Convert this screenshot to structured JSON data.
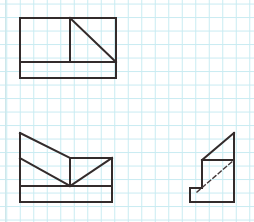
{
  "canvas": {
    "width": 254,
    "height": 222,
    "background_color": "#ffffff"
  },
  "grid": {
    "type": "graph-paper",
    "minor_spacing_px": 13.5,
    "minor_color": "#c9ecf2",
    "minor_width_px": 1,
    "margin_rule_x": 5,
    "margin_rule_color": "#cfe7ea",
    "description": "light cyan square grid graph paper"
  },
  "ink": {
    "stroke_color": "#332b2b",
    "stroke_width_px": 2,
    "dashed_stroke_color": "#45393a",
    "dashed_stroke_width_px": 1.4,
    "dash_pattern": "4 3"
  },
  "figures": [
    {
      "id": "figure-top-left",
      "name": "rectangle-with-divider-and-diagonal",
      "label": "",
      "bounds": {
        "x": 20,
        "y": 18,
        "width": 96,
        "height": 60
      },
      "paths": [
        {
          "name": "outer-rectangle",
          "style": "solid",
          "points": [
            [
              20,
              18
            ],
            [
              116,
              18
            ],
            [
              116,
              78
            ],
            [
              20,
              78
            ],
            [
              20,
              18
            ]
          ]
        },
        {
          "name": "horizontal-divider",
          "style": "solid",
          "points": [
            [
              20,
              62
            ],
            [
              116,
              62
            ]
          ]
        },
        {
          "name": "vertical-divider",
          "style": "solid",
          "points": [
            [
              70,
              18
            ],
            [
              70,
              62
            ]
          ]
        },
        {
          "name": "diagonal-hypotenuse",
          "style": "solid",
          "points": [
            [
              70,
              18
            ],
            [
              116,
              62
            ]
          ]
        }
      ]
    },
    {
      "id": "figure-bottom-left",
      "name": "chevron-v-shape-on-base",
      "label": "",
      "bounds": {
        "x": 20,
        "y": 133,
        "width": 92,
        "height": 69
      },
      "paths": [
        {
          "name": "left-vertical-edge",
          "style": "solid",
          "points": [
            [
              20,
              133
            ],
            [
              20,
              202
            ]
          ]
        },
        {
          "name": "upper-left-slope",
          "style": "solid",
          "points": [
            [
              20,
              133
            ],
            [
              70,
              158
            ]
          ]
        },
        {
          "name": "top-right-edge",
          "style": "solid",
          "points": [
            [
              70,
              158
            ],
            [
              112,
              158
            ]
          ]
        },
        {
          "name": "right-vertical-edge",
          "style": "solid",
          "points": [
            [
              112,
              158
            ],
            [
              112,
              202
            ]
          ]
        },
        {
          "name": "bottom-edge",
          "style": "solid",
          "points": [
            [
              20,
              202
            ],
            [
              112,
              202
            ]
          ]
        },
        {
          "name": "horizontal-divider",
          "style": "solid",
          "points": [
            [
              20,
              186
            ],
            [
              112,
              186
            ]
          ]
        },
        {
          "name": "left-v-slope",
          "style": "solid",
          "points": [
            [
              20,
              158
            ],
            [
              70,
              186
            ]
          ]
        },
        {
          "name": "right-v-slope",
          "style": "solid",
          "points": [
            [
              70,
              186
            ],
            [
              112,
              158
            ]
          ]
        },
        {
          "name": "center-vertical",
          "style": "solid",
          "points": [
            [
              70,
              158
            ],
            [
              70,
              186
            ]
          ]
        }
      ]
    },
    {
      "id": "figure-bottom-right",
      "name": "stepped-wedge-with-hidden-line",
      "label": "",
      "bounds": {
        "x": 190,
        "y": 133,
        "width": 44,
        "height": 69
      },
      "paths": [
        {
          "name": "top-slope",
          "style": "solid",
          "points": [
            [
              202,
              160
            ],
            [
              234,
              133
            ]
          ]
        },
        {
          "name": "right-vertical-edge",
          "style": "solid",
          "points": [
            [
              234,
              133
            ],
            [
              234,
              202
            ]
          ]
        },
        {
          "name": "bottom-edge",
          "style": "solid",
          "points": [
            [
              190,
              202
            ],
            [
              234,
              202
            ]
          ]
        },
        {
          "name": "step-left-vertical",
          "style": "solid",
          "points": [
            [
              190,
              202
            ],
            [
              190,
              188
            ]
          ]
        },
        {
          "name": "step-horizontal",
          "style": "solid",
          "points": [
            [
              190,
              188
            ],
            [
              202,
              188
            ]
          ]
        },
        {
          "name": "step-upper-vertical",
          "style": "solid",
          "points": [
            [
              202,
              188
            ],
            [
              202,
              160
            ]
          ]
        },
        {
          "name": "mid-horizontal",
          "style": "solid",
          "points": [
            [
              202,
              160
            ],
            [
              234,
              160
            ]
          ]
        },
        {
          "name": "hidden-diagonal",
          "style": "dashed",
          "points": [
            [
              197,
              192
            ],
            [
              234,
              160
            ]
          ]
        }
      ]
    }
  ]
}
